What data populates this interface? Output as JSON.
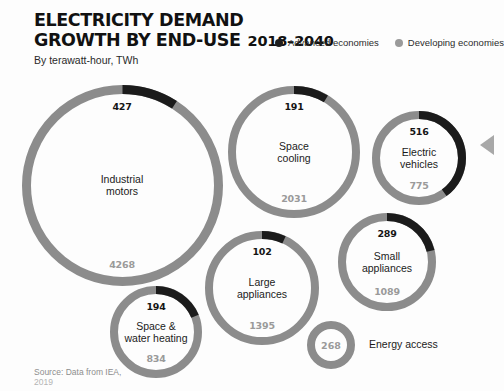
{
  "header": {
    "title_line1": "ELECTRICITY DEMAND",
    "title_line2": "GROWTH BY END-USE",
    "years": "2018–2040",
    "subtitle": "By terawatt-hour, TWh"
  },
  "legend": {
    "items": [
      {
        "label": "Advanced economies",
        "color": "#1e1e1e",
        "icon": "legend-dot-icon"
      },
      {
        "label": "Developing economies",
        "color": "#9a9a9a",
        "icon": "legend-dot-icon"
      }
    ]
  },
  "colors": {
    "advanced": "#1b1b1b",
    "developing": "#8c8c8c",
    "background": "#fdfdfd",
    "text": "#1b1b1b",
    "muted": "#9a9a9a"
  },
  "source": {
    "line1": "Source: Data from IEA,",
    "line2": "2019"
  },
  "nav": {
    "next_arrow_icon": "chevron-left-icon"
  },
  "chart_data": {
    "type": "pie",
    "title": "ELECTRICITY DEMAND GROWTH BY END-USE 2018–2040",
    "subtitle": "By terawatt-hour, TWh",
    "unit": "TWh",
    "period": "2018–2040",
    "series": [
      {
        "name": "Advanced economies",
        "color": "#1b1b1b"
      },
      {
        "name": "Developing economies",
        "color": "#8c8c8c"
      }
    ],
    "categories": [
      "Industrial motors",
      "Space cooling",
      "Electric vehicles",
      "Small appliances",
      "Large appliances",
      "Space & water heating",
      "Energy access"
    ],
    "items": [
      {
        "name": "Industrial motors",
        "name_lines": [
          "Industrial",
          "motors"
        ],
        "advanced": 427,
        "developing": 4268,
        "total": 4695,
        "advanced_label": "427",
        "developing_label": "4268",
        "radius": 96,
        "stroke": 9,
        "cx": 122,
        "cy": 185
      },
      {
        "name": "Space cooling",
        "name_lines": [
          "Space",
          "cooling"
        ],
        "advanced": 191,
        "developing": 2031,
        "total": 2222,
        "advanced_label": "191",
        "developing_label": "2031",
        "radius": 62,
        "stroke": 8,
        "cx": 294,
        "cy": 152
      },
      {
        "name": "Electric vehicles",
        "name_lines": [
          "Electric",
          "vehicles"
        ],
        "advanced": 516,
        "developing": 775,
        "total": 1291,
        "advanced_label": "516",
        "developing_label": "775",
        "radius": 43,
        "stroke": 8,
        "cx": 419,
        "cy": 158
      },
      {
        "name": "Small appliances",
        "name_lines": [
          "Small",
          "appliances"
        ],
        "advanced": 289,
        "developing": 1089,
        "total": 1378,
        "advanced_label": "289",
        "developing_label": "1089",
        "radius": 45,
        "stroke": 8,
        "cx": 387,
        "cy": 262
      },
      {
        "name": "Large appliances",
        "name_lines": [
          "Large",
          "appliances"
        ],
        "advanced": 102,
        "developing": 1395,
        "total": 1497,
        "advanced_label": "102",
        "developing_label": "1395",
        "radius": 53,
        "stroke": 8,
        "cx": 262,
        "cy": 288
      },
      {
        "name": "Space & water heating",
        "name_lines": [
          "Space &",
          "water heating"
        ],
        "advanced": 194,
        "developing": 834,
        "total": 1028,
        "advanced_label": "194",
        "developing_label": "834",
        "radius": 42,
        "stroke": 8,
        "cx": 156,
        "cy": 332
      },
      {
        "name": "Energy access",
        "name_lines": [],
        "advanced": 0,
        "developing": 268,
        "total": 268,
        "advanced_label": "",
        "developing_label": "268",
        "radius": 20,
        "stroke": 8,
        "cx": 331,
        "cy": 345,
        "outside_label": "Energy access"
      }
    ]
  }
}
